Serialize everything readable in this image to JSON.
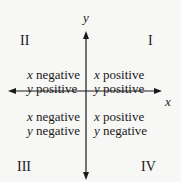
{
  "axes": {
    "x_label": "x",
    "y_label": "y"
  },
  "quadrants": {
    "I": {
      "name": "I",
      "x_var": "x",
      "x_sign": "positive",
      "y_var": "y",
      "y_sign": "positive"
    },
    "II": {
      "name": "II",
      "x_var": "x",
      "x_sign": "negative",
      "y_var": "y",
      "y_sign": "positive"
    },
    "III": {
      "name": "III",
      "x_var": "x",
      "x_sign": "negative",
      "y_var": "y",
      "y_sign": "negative"
    },
    "IV": {
      "name": "IV",
      "x_var": "x",
      "x_sign": "positive",
      "y_var": "y",
      "y_sign": "negative"
    }
  },
  "colors": {
    "background": "#f7f7f5",
    "ink": "#1a1a1a"
  }
}
